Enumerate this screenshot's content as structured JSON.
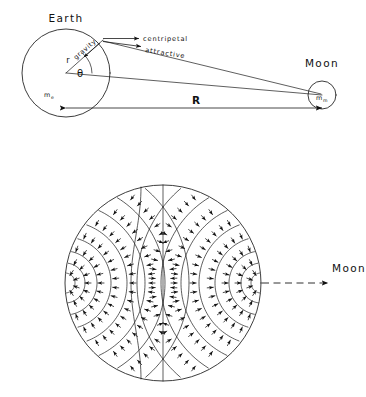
{
  "figure": {
    "background_color": "#ffffff",
    "ink_color": "#111111",
    "width": 366,
    "height": 397
  },
  "panel_top": {
    "name": "earth-moon-geometry",
    "earth_label": "Earth",
    "earth_mass_symbol": "m",
    "earth_mass_subscript": "e",
    "moon_label": "Moon",
    "moon_mass_symbol": "m",
    "moon_mass_subscript": "m",
    "radius_label": "r",
    "gravity_label": "gravity",
    "angle_label": "θ",
    "distance_label": "R",
    "vector_centripetal": "centripetal",
    "vector_attractive": "attractive",
    "geometry": {
      "earth_center_x": 66,
      "earth_center_y": 73,
      "earth_radius": 44,
      "moon_center_x": 322,
      "moon_center_y": 95,
      "moon_radius": 14,
      "surface_point_x": 103,
      "surface_point_y": 40,
      "angle_degrees": 48,
      "distance_arrow_y": 108
    }
  },
  "panel_bottom": {
    "name": "tidal-field-map",
    "moon_label": "Moon",
    "geometry": {
      "center_x": 163,
      "center_y": 283,
      "radius": 98,
      "moon_arrow_start_x": 262,
      "moon_arrow_end_x": 330,
      "moon_arrow_y": 283
    },
    "description": "Circle representing Earth with tidal acceleration field: arrows point outward toward and away from the Moon, with nested curved equipotential arcs on the near and far sides and a straight vertical dividing line through the centre."
  }
}
